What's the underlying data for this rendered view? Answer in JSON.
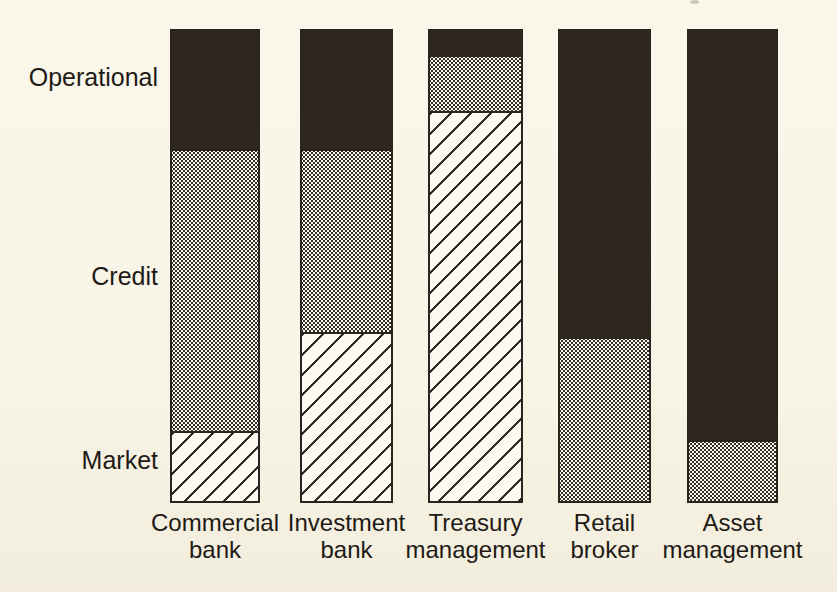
{
  "figure": {
    "background_color": "#f8f4e6",
    "bar_outline_color": "#2a241e",
    "solid_fill_color": "#2f261d",
    "pattern_ink_color": "#2e2a24",
    "pattern_base_color": "#fcf9f0",
    "text_color": "#1e1a16"
  },
  "chart_data": {
    "type": "bar",
    "subtype": "stacked-100-percent-vertical",
    "title": "",
    "xlabel": "",
    "ylabel": "",
    "axes": "none",
    "grid": "off",
    "legend_position": "left-side-row-labels",
    "row_labels": [
      "Operational",
      "Credit",
      "Market"
    ],
    "categories": [
      "Commercial bank",
      "Investment bank",
      "Treasury management",
      "Retail broker",
      "Asset management"
    ],
    "category_label_lines": [
      [
        "Commercial",
        "bank"
      ],
      [
        "Investment",
        "bank"
      ],
      [
        "Treasury",
        "management"
      ],
      [
        "Retail",
        "broker"
      ],
      [
        "Asset",
        "management"
      ]
    ],
    "series": [
      {
        "name": "Operational",
        "pattern": "solid-dark",
        "values": [
          25,
          25,
          5,
          65,
          87
        ]
      },
      {
        "name": "Credit",
        "pattern": "fine-dots",
        "values": [
          60,
          39,
          12,
          35,
          13
        ]
      },
      {
        "name": "Market",
        "pattern": "diagonal-hatch",
        "values": [
          15,
          36,
          83,
          0,
          0
        ]
      }
    ],
    "values_note": "approximate percent of each bar's height, estimated from pixels; no numeric axis shown"
  }
}
